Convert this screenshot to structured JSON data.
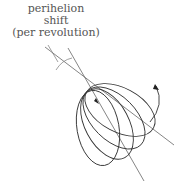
{
  "figure": {
    "label_lines": [
      "perihelion",
      "shift",
      "(per revolution)"
    ],
    "colors": {
      "ink": "#333333",
      "axis": "#666666",
      "text": "#555555"
    },
    "elements": {
      "orbit_count": 4,
      "rotation_direction": "counterclockwise arrow",
      "axis_lines": 2
    }
  }
}
